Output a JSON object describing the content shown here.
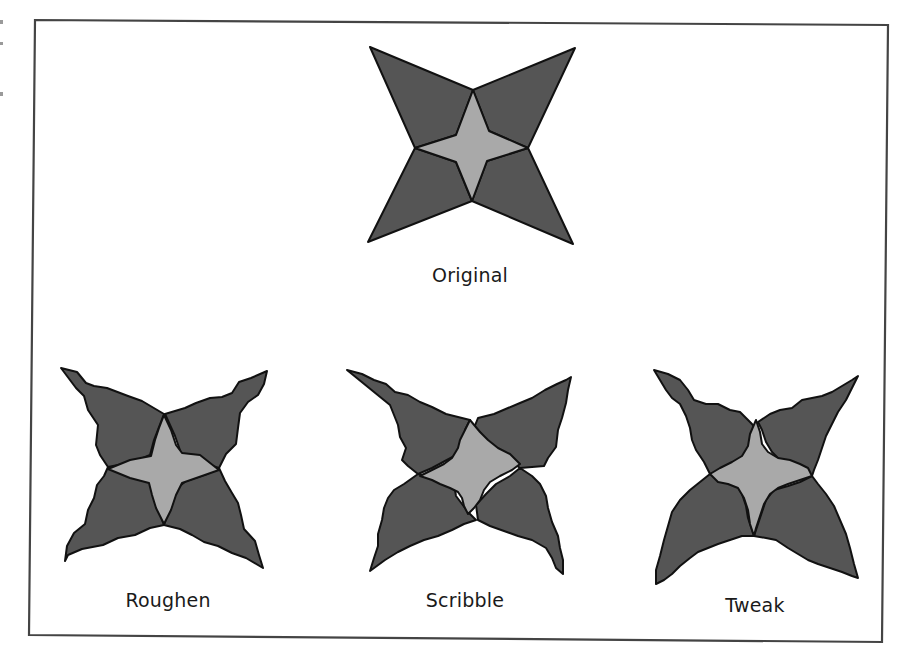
{
  "figure": {
    "colors": {
      "background": "#ffffff",
      "frame": "#444444",
      "outline": "#111111",
      "dark_fill": "#555555",
      "light_fill": "#a9a9a9"
    },
    "frame_points": "35,20 888,25 882,642 29,635",
    "panels": [
      {
        "id": "original",
        "label": "Original",
        "label_x": 470,
        "label_y": 264,
        "dark_petals": [
          "370,47 473,90 456,135 415,148",
          "575,48 528,148 489,131 473,90",
          "415,148 456,162 472,201 368,242",
          "528,148 573,244 472,201 487,161"
        ],
        "light_star": "473,90 489,131 528,148 487,161 472,201 456,162 415,148 456,135"
      },
      {
        "id": "roughen",
        "label": "Roughen",
        "label_x": 168,
        "label_y": 589,
        "dark_petals": [
          "61,368 77,372 86,383 94,386 107,388 128,396 142,401 164,414 154,440 150,455 133,462 108,467 100,455 96,445 98,425 88,410 84,396 76,388",
          "267,371 264,384 258,395 248,402 240,413 238,428 236,444 226,454 219,468 200,462 181,453 175,436 165,414 185,408 196,403 210,398 222,397 232,393 239,382 251,378",
          "108,467 133,476 150,482 155,500 164,525 150,528 135,535 118,538 103,545 82,549 68,555 65,561 67,546 74,533 85,524 88,510 94,498 97,485 104,476",
          "219,468 207,474 186,481 176,489 164,525 180,529 192,535 204,542 218,546 232,553 246,558 263,568 259,555 255,541 244,529 241,515 238,503 232,493 225,481"
        ],
        "light_star": "164,415 171,430 176,445 182,453 200,455 219,470 202,476 182,483 176,495 171,510 164,524 156,508 152,495 149,483 130,478 108,469 130,460 151,456 155,440 159,428"
      },
      {
        "id": "scribble",
        "label": "Scribble",
        "label_x": 465,
        "label_y": 589,
        "dark_petals": [
          "347,370 362,374 374,380 386,384 395,392 408,395 420,402 432,407 446,414 470,420 465,430 468,437 460,443 462,452 445,461 432,468 418,474 408,466 402,460 406,448 400,437 398,425 394,415 390,405",
          "571,377 568,390 566,403 562,418 558,430 556,447 548,458 544,466 520,468 507,458 498,452 491,444 484,440 480,432 474,428 478,418 494,414 508,408 520,403 532,398 545,390 557,384 566,380",
          "418,474 438,478 454,484 456,496 462,504 468,512 476,520 464,524 452,530 438,536 424,540 410,546 398,552 385,560 370,571 374,558 378,546 378,534 382,520 384,508 388,498 394,490 404,484",
          "520,468 510,476 496,484 486,494 476,505 478,520 490,526 504,531 518,536 532,540 546,548 552,558 556,568 563,574 563,560 560,548 558,536 552,522 548,508 546,496 540,484 532,476"
        ],
        "light_star": "470,420 480,432 488,440 498,448 510,454 520,464 512,470 500,476 490,482 484,490 480,500 474,508 468,514 464,506 462,498 458,492 450,488 440,484 432,480 420,476 432,470 444,464 452,458 458,448 460,440 464,432"
      },
      {
        "id": "tweak",
        "label": "Tweak",
        "label_x": 755,
        "label_y": 594,
        "dark_petals": [
          "654,370 668,374 680,380 688,390 694,400 706,404 718,404 730,410 740,412 746,418 752,424 756,430 752,438 748,450 744,460 734,466 724,470 710,474 704,462 696,450 692,440 690,428 686,416 680,404 672,398 666,390 660,380",
          "858,376 852,388 846,400 838,412 832,424 826,436 822,448 818,460 814,470 812,476 798,470 790,464 780,460 772,452 766,442 762,430 758,422 770,414 780,410 792,408 802,400 812,398 822,396 832,392 842,386 852,380",
          "710,474 722,478 736,484 742,494 746,506 748,518 752,530 754,536 742,536 730,540 718,544 708,548 698,552 690,558 680,566 672,574 664,580 656,584 656,570 660,556 664,540 668,526 672,512 680,500 690,490 700,482",
          "812,476 800,482 788,486 774,490 766,500 762,512 758,524 754,536 766,538 776,540 788,548 798,554 808,560 818,564 830,568 842,572 852,576 858,578 854,564 850,548 846,534 840,520 834,506 826,494 818,484"
        ],
        "light_star": "756,420 760,432 762,444 768,452 778,458 790,460 800,464 808,468 812,476 800,480 788,484 778,488 770,494 764,504 760,516 756,528 754,536 750,524 748,510 744,498 738,488 728,484 718,482 710,474 720,468 732,462 742,456 748,446 750,434"
      }
    ]
  }
}
